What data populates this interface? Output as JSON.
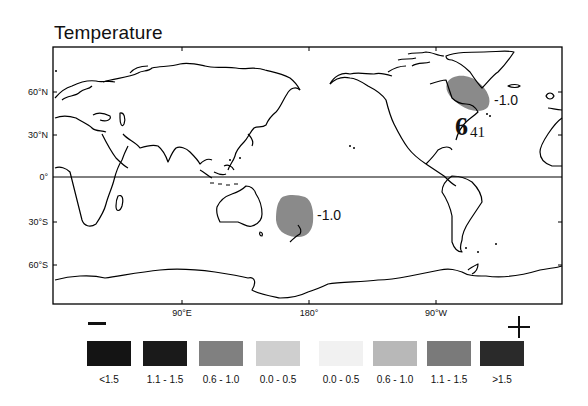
{
  "title": "Temperature",
  "axes": {
    "lat_labels": [
      {
        "label": "60°N",
        "y": 92
      },
      {
        "label": "30°N",
        "y": 135
      },
      {
        "label": "0°",
        "y": 177
      },
      {
        "label": "30°S",
        "y": 222
      },
      {
        "label": "60°S",
        "y": 265
      }
    ],
    "lon_labels": [
      {
        "label": "90°E",
        "x": 182
      },
      {
        "label": "180°",
        "x": 309
      },
      {
        "label": "90°W",
        "x": 436
      }
    ]
  },
  "annotations": {
    "north_atlantic": {
      "value": "-1.0"
    },
    "southwest_pacific": {
      "value": "-1.0"
    },
    "hurricane_symbol": "6",
    "hurricane_number": "41"
  },
  "legend": {
    "minus_sign": "—",
    "plus_sign": "+",
    "items": [
      {
        "label": "<1.5",
        "color": "#141414"
      },
      {
        "label": "1.1 - 1.5",
        "color": "#1a1a1a"
      },
      {
        "label": "0.6 - 1.0",
        "color": "#808080"
      },
      {
        "label": "0.0 - 0.5",
        "color": "#cfcfcf"
      },
      {
        "label": "0.0 - 0.5",
        "color": "#f1f1f1"
      },
      {
        "label": "0.6 - 1.0",
        "color": "#b8b8b8"
      },
      {
        "label": "1.1 - 1.5",
        "color": "#7a7a7a"
      },
      {
        "label": ">1.5",
        "color": "#2a2a2a"
      }
    ]
  },
  "colors": {
    "anomaly_fill": "#8a8a8a",
    "coastline": "#000000",
    "frame": "#000000"
  }
}
